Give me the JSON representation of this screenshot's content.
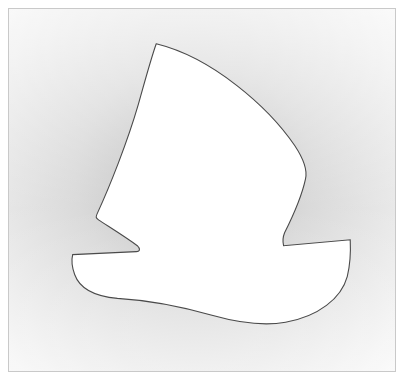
{
  "canvas": {
    "width": 404,
    "height": 385,
    "background_color": "#ffffff",
    "description": "Abstract white silhouette of a sailboat / witch hat shape on a soft gray vignette background inside a thin rectangular frame"
  },
  "frame": {
    "name": "image-frame",
    "left": 8,
    "top": 8,
    "width": 388,
    "height": 364,
    "border_color": "#c9c9c9",
    "border_width": 1,
    "fill_color": "#ffffff"
  },
  "background": {
    "name": "gray-vignette",
    "type": "radial-gradient",
    "inner_color": "#b9b9b9",
    "mid_color": "#d8d8d8",
    "outer_color": "#f7f7f7",
    "center_x_pct": 48,
    "center_y_pct": 46
  },
  "figure": {
    "name": "boat-silhouette",
    "fill_color": "#ffffff",
    "stroke_color": "#4a4a4a",
    "stroke_width": 1.1,
    "anchors": {
      "apex": {
        "x": 157,
        "y": 44
      },
      "right_bulge": {
        "x": 307,
        "y": 180
      },
      "right_notch_inner": {
        "x": 285,
        "y": 247
      },
      "right_tip": {
        "x": 352,
        "y": 241
      },
      "hull_bottom": {
        "x": 213,
        "y": 322
      },
      "left_hull_shoulder": {
        "x": 73,
        "y": 256
      },
      "left_notch_inner": {
        "x": 137,
        "y": 253
      },
      "left_sail_point": {
        "x": 97,
        "y": 219
      }
    },
    "path": "M157,44 C214,58 270,108 296,146 C306,161 309,172 307,180 C304,194 296,214 286,234 C284,239 284,243 285,247 L352,241 C352,241 353,262 349,278 C343,300 320,318 287,324 C265,328 238,324 213,317 C185,309 151,302 118,300 C95,298 80,290 75,276 C71,265 72,260 73,256 L137,253 C141,253 141,250 138,247 C126,238 108,227 99,221 C96,219 96,218 98,214 C110,188 128,143 139,105 C146,80 152,58 157,44 Z"
  },
  "labels": {
    "title": "",
    "caption": ""
  }
}
